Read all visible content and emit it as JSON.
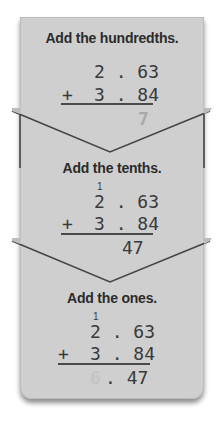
{
  "steps": [
    {
      "title": "Add the hundredths.",
      "carry": "",
      "top": "2 . 63",
      "operator": "+",
      "bottom": "3 . 84",
      "result_faded": "7",
      "result_dark": ""
    },
    {
      "title": "Add the tenths.",
      "carry": "1",
      "top": "2 . 63",
      "operator": "+",
      "bottom": "3 . 84",
      "result_faded": "",
      "result_dark": "47"
    },
    {
      "title": "Add the ones.",
      "carry": "1",
      "top": "2 . 63",
      "operator": "+",
      "bottom": "3 . 84",
      "result_faded": "6",
      "result_dark": ". 47"
    }
  ],
  "colors": {
    "panel": "#cfcfcf",
    "text": "#2b2b2b",
    "faded_digit": "#a9a9a9"
  }
}
